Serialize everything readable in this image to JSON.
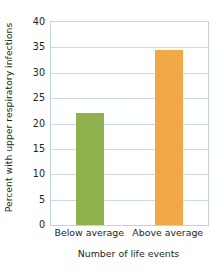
{
  "chart_data": {
    "type": "bar",
    "title": "",
    "categories": [
      "Below average",
      "Above average"
    ],
    "values": [
      22.1,
      34.5
    ],
    "xlabel": "Number of life events",
    "ylabel": "Percent with upper respiratory infections",
    "ylim": [
      0,
      40
    ],
    "yticks": [
      0,
      5,
      10,
      15,
      20,
      25,
      30,
      35,
      40
    ],
    "ytick_labels": [
      "0",
      "5",
      "10",
      "15",
      "20",
      "25",
      "30",
      "35",
      "40"
    ],
    "grid": true,
    "legend": null,
    "bar_colors": [
      "#8fb14e",
      "#f3a847"
    ],
    "grid_color": "#ccd9e8",
    "frame_color": "#c3d2e3",
    "text_color": "#231f20",
    "background": "#ffffff"
  }
}
